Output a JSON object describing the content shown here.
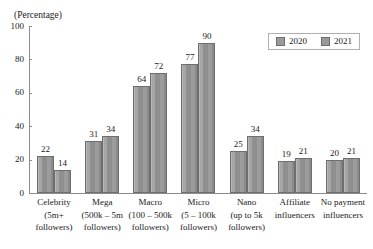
{
  "chart_data": {
    "type": "bar",
    "title": "",
    "xlabel": "",
    "ylabel": "(Percentage)",
    "ylim": [
      0,
      100
    ],
    "yticks": [
      0,
      20,
      40,
      60,
      80,
      100
    ],
    "grid": false,
    "legend_position": "top-right",
    "categories": [
      "Celebrity (5m+ followers)",
      "Mega (500k – 5m followers)",
      "Macro (100 – 500k followers)",
      "Micro (5 – 100k followers)",
      "Nano (up to 5k followers)",
      "Affiliate influencers",
      "No payment influencers"
    ],
    "category_lines": [
      [
        "Celebrity",
        "(5m+",
        "followers)"
      ],
      [
        "Mega",
        "(500k – 5m",
        "followers)"
      ],
      [
        "Macro",
        "(100 – 500k",
        "followers)"
      ],
      [
        "Micro",
        "(5 – 100k",
        "followers)"
      ],
      [
        "Nano",
        "(up to 5k",
        "followers)"
      ],
      [
        "Affiliate",
        "influencers",
        ""
      ],
      [
        "No payment",
        "influencers",
        ""
      ]
    ],
    "series": [
      {
        "name": "2020",
        "values": [
          22,
          31,
          64,
          77,
          25,
          19,
          20
        ]
      },
      {
        "name": "2021",
        "values": [
          14,
          34,
          72,
          90,
          34,
          21,
          21
        ]
      }
    ]
  },
  "legend": {
    "items": [
      {
        "label": "2020",
        "color": "#9a9a9a"
      },
      {
        "label": "2021",
        "color": "#9a9a9a"
      }
    ]
  },
  "axis": {
    "unit_caption": "(Percentage)",
    "y_tick_labels": [
      "100",
      "80",
      "60",
      "40",
      "20",
      "0"
    ]
  },
  "clipped_title": ""
}
